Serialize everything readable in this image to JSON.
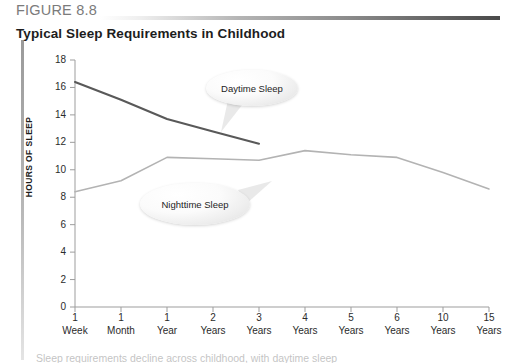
{
  "figure": {
    "label": "FIGURE 8.8",
    "title": "Typical Sleep Requirements in Childhood",
    "caption_partial": "Sleep requirements decline across childhood, with daytime sleep"
  },
  "colors": {
    "daytime_line": "#595959",
    "nighttime_line": "#b3b3b3",
    "axis": "#9d9d9d",
    "rule_dark": "#4a4a4a",
    "text": "#231f20",
    "label_gray": "#7b7b7b"
  },
  "callouts": [
    {
      "name": "daytime",
      "label": "Daytime Sleep"
    },
    {
      "name": "nighttime",
      "label": "Nighttime Sleep"
    }
  ],
  "chart_data": {
    "type": "line",
    "title": "Typical Sleep Requirements in Childhood",
    "xlabel": "",
    "ylabel": "HOURS OF SLEEP",
    "ylim": [
      0,
      18
    ],
    "ytick_step": 2,
    "yticks": [
      18,
      16,
      14,
      12,
      10,
      8,
      6,
      4,
      2,
      0
    ],
    "grid": false,
    "legend": "inline-callouts",
    "categories": [
      "1 Week",
      "1 Month",
      "1 Year",
      "2 Years",
      "3 Years",
      "4 Years",
      "5 Years",
      "6 Years",
      "10 Years",
      "15 Years"
    ],
    "xtick_lines": [
      [
        "1",
        "Week"
      ],
      [
        "1",
        "Month"
      ],
      [
        "1",
        "Year"
      ],
      [
        "2",
        "Years"
      ],
      [
        "3",
        "Years"
      ],
      [
        "4",
        "Years"
      ],
      [
        "5",
        "Years"
      ],
      [
        "6",
        "Years"
      ],
      [
        "10",
        "Years"
      ],
      [
        "15",
        "Years"
      ]
    ],
    "series": [
      {
        "name": "Daytime Sleep",
        "color": "#595959",
        "values": [
          16.4,
          15.1,
          13.7,
          12.8,
          11.9,
          null,
          null,
          null,
          null,
          null
        ]
      },
      {
        "name": "Nighttime Sleep",
        "color": "#b3b3b3",
        "values": [
          8.4,
          9.2,
          10.9,
          10.8,
          10.7,
          11.4,
          11.1,
          10.9,
          9.8,
          8.6
        ]
      }
    ]
  }
}
